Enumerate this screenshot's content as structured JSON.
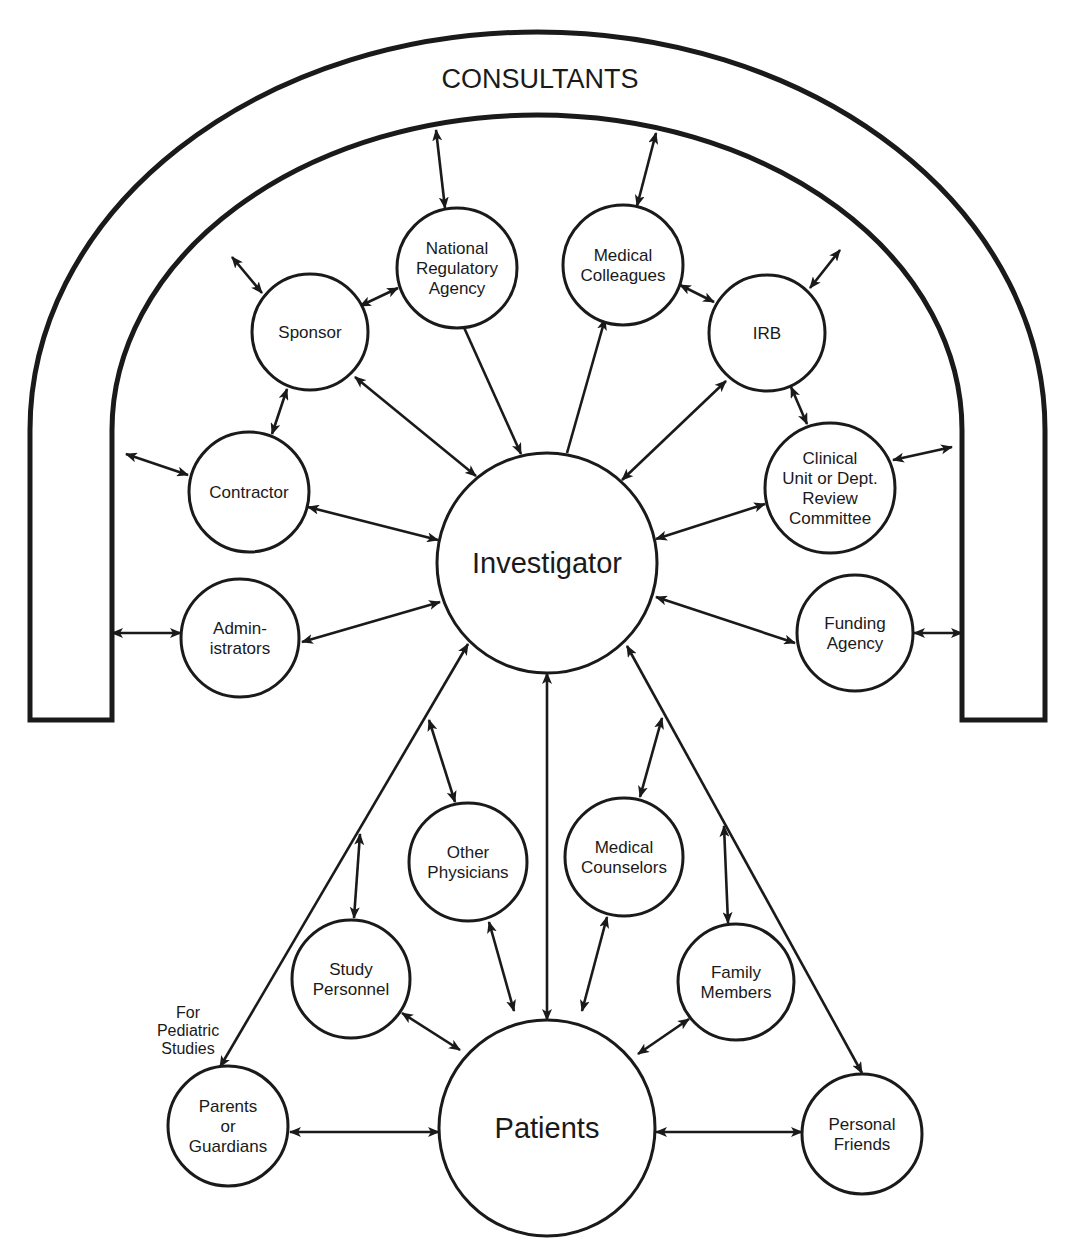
{
  "diagram": {
    "title": "CONSULTANTS",
    "colors": {
      "stroke": "#1a1a1a",
      "background": "#ffffff"
    },
    "arch": {
      "outer": {
        "left": 30,
        "right": 1045,
        "top": 32,
        "bottom": 720
      },
      "inner": {
        "left": 112,
        "right": 962,
        "top": 115,
        "bottom": 720
      }
    },
    "nodes": [
      {
        "id": "investigator",
        "lines": [
          "Investigator"
        ],
        "cx": 547,
        "cy": 563,
        "r": 110,
        "size": "big"
      },
      {
        "id": "patients",
        "lines": [
          "Patients"
        ],
        "cx": 547,
        "cy": 1128,
        "r": 108,
        "size": "big"
      },
      {
        "id": "national-regulatory-agency",
        "lines": [
          "National",
          "Regulatory",
          "Agency"
        ],
        "cx": 457,
        "cy": 268,
        "r": 60
      },
      {
        "id": "medical-colleagues",
        "lines": [
          "Medical",
          "Colleagues"
        ],
        "cx": 623,
        "cy": 265,
        "r": 60
      },
      {
        "id": "sponsor",
        "lines": [
          "Sponsor"
        ],
        "cx": 310,
        "cy": 332,
        "r": 58
      },
      {
        "id": "irb",
        "lines": [
          "IRB"
        ],
        "cx": 767,
        "cy": 333,
        "r": 58
      },
      {
        "id": "contractor",
        "lines": [
          "Contractor"
        ],
        "cx": 249,
        "cy": 492,
        "r": 60
      },
      {
        "id": "clinical-unit-review-committee",
        "lines": [
          "Clinical",
          "Unit or Dept.",
          "Review",
          "Committee"
        ],
        "cx": 830,
        "cy": 488,
        "r": 65
      },
      {
        "id": "administrators",
        "lines": [
          "Admin-",
          "istrators"
        ],
        "cx": 240,
        "cy": 638,
        "r": 59
      },
      {
        "id": "funding-agency",
        "lines": [
          "Funding",
          "Agency"
        ],
        "cx": 855,
        "cy": 633,
        "r": 58
      },
      {
        "id": "other-physicians",
        "lines": [
          "Other",
          "Physicians"
        ],
        "cx": 468,
        "cy": 862,
        "r": 59
      },
      {
        "id": "medical-counselors",
        "lines": [
          "Medical",
          "Counselors"
        ],
        "cx": 624,
        "cy": 857,
        "r": 59
      },
      {
        "id": "study-personnel",
        "lines": [
          "Study",
          "Personnel"
        ],
        "cx": 351,
        "cy": 979,
        "r": 59
      },
      {
        "id": "family-members",
        "lines": [
          "Family",
          "Members"
        ],
        "cx": 736,
        "cy": 982,
        "r": 58
      },
      {
        "id": "parents-or-guardians",
        "lines": [
          "Parents",
          "or",
          "Guardians"
        ],
        "cx": 228,
        "cy": 1126,
        "r": 60
      },
      {
        "id": "personal-friends",
        "lines": [
          "Personal",
          "Friends"
        ],
        "cx": 862,
        "cy": 1134,
        "r": 60
      }
    ],
    "note": {
      "lines": [
        "For",
        "Pediatric",
        "Studies"
      ],
      "x": 188,
      "y": 1018
    },
    "edges": [
      {
        "x1": 436,
        "y1": 130,
        "x2": 445,
        "y2": 208,
        "heads": "both"
      },
      {
        "x1": 656,
        "y1": 133,
        "x2": 637,
        "y2": 206,
        "heads": "both"
      },
      {
        "x1": 232,
        "y1": 257,
        "x2": 262,
        "y2": 293,
        "heads": "both"
      },
      {
        "x1": 840,
        "y1": 250,
        "x2": 810,
        "y2": 288,
        "heads": "both"
      },
      {
        "x1": 360,
        "y1": 306,
        "x2": 398,
        "y2": 288,
        "heads": "both"
      },
      {
        "x1": 680,
        "y1": 285,
        "x2": 714,
        "y2": 302,
        "heads": "both"
      },
      {
        "x1": 287,
        "y1": 389,
        "x2": 272,
        "y2": 434,
        "heads": "both"
      },
      {
        "x1": 791,
        "y1": 387,
        "x2": 807,
        "y2": 424,
        "heads": "both"
      },
      {
        "x1": 462,
        "y1": 323,
        "x2": 521,
        "y2": 454,
        "heads": "end"
      },
      {
        "x1": 605,
        "y1": 319,
        "x2": 567,
        "y2": 453,
        "heads": "start"
      },
      {
        "x1": 355,
        "y1": 377,
        "x2": 476,
        "y2": 476,
        "heads": "both"
      },
      {
        "x1": 726,
        "y1": 381,
        "x2": 622,
        "y2": 480,
        "heads": "both"
      },
      {
        "x1": 126,
        "y1": 454,
        "x2": 188,
        "y2": 475,
        "heads": "both"
      },
      {
        "x1": 952,
        "y1": 447,
        "x2": 893,
        "y2": 460,
        "heads": "both"
      },
      {
        "x1": 308,
        "y1": 507,
        "x2": 438,
        "y2": 540,
        "heads": "both"
      },
      {
        "x1": 765,
        "y1": 504,
        "x2": 656,
        "y2": 539,
        "heads": "both"
      },
      {
        "x1": 112,
        "y1": 633,
        "x2": 181,
        "y2": 633,
        "heads": "both"
      },
      {
        "x1": 962,
        "y1": 633,
        "x2": 914,
        "y2": 633,
        "heads": "both"
      },
      {
        "x1": 302,
        "y1": 642,
        "x2": 440,
        "y2": 602,
        "heads": "both"
      },
      {
        "x1": 656,
        "y1": 597,
        "x2": 795,
        "y2": 643,
        "heads": "both"
      },
      {
        "x1": 547,
        "y1": 673,
        "x2": 547,
        "y2": 1020,
        "heads": "both"
      },
      {
        "x1": 468,
        "y1": 644,
        "x2": 220,
        "y2": 1067,
        "heads": "both"
      },
      {
        "x1": 627,
        "y1": 646,
        "x2": 862,
        "y2": 1073,
        "heads": "both"
      },
      {
        "x1": 429,
        "y1": 720,
        "x2": 455,
        "y2": 802,
        "heads": "both"
      },
      {
        "x1": 662,
        "y1": 718,
        "x2": 640,
        "y2": 797,
        "heads": "both"
      },
      {
        "x1": 360,
        "y1": 834,
        "x2": 354,
        "y2": 918,
        "heads": "both"
      },
      {
        "x1": 724,
        "y1": 826,
        "x2": 728,
        "y2": 923,
        "heads": "both"
      },
      {
        "x1": 489,
        "y1": 922,
        "x2": 514,
        "y2": 1011,
        "heads": "both"
      },
      {
        "x1": 607,
        "y1": 917,
        "x2": 582,
        "y2": 1011,
        "heads": "both"
      },
      {
        "x1": 402,
        "y1": 1013,
        "x2": 460,
        "y2": 1050,
        "heads": "both"
      },
      {
        "x1": 689,
        "y1": 1019,
        "x2": 638,
        "y2": 1054,
        "heads": "both"
      },
      {
        "x1": 290,
        "y1": 1132,
        "x2": 439,
        "y2": 1132,
        "heads": "both"
      },
      {
        "x1": 656,
        "y1": 1132,
        "x2": 802,
        "y2": 1132,
        "heads": "both"
      }
    ]
  }
}
